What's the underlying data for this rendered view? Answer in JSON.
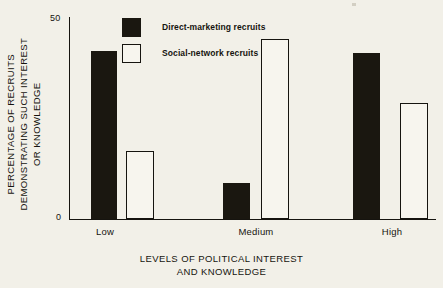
{
  "chart_data": {
    "type": "bar",
    "title": "",
    "xlabel": "LEVELS OF POLITICAL INTEREST AND KNOWLEDGE",
    "ylabel": "PERCENTAGE OF RECRUITS DEMONSTRATING SUCH INTEREST OR KNOWLEDGE",
    "categories": [
      "Low",
      "Medium",
      "High"
    ],
    "series": [
      {
        "name": "Direct-marketing recruits",
        "values": [
          42,
          9,
          41.5
        ],
        "color": "#1a1710",
        "style": "filled"
      },
      {
        "name": "Social-network recruits",
        "values": [
          17,
          45,
          29
        ],
        "color": "#f7f5ee",
        "style": "hollow"
      }
    ],
    "ylim": [
      0,
      50
    ],
    "yticks": [
      "0",
      "50"
    ],
    "grid": false,
    "legend_position": "top-center"
  },
  "axis": {
    "y_title_lines": [
      "PERCENTAGE OF RECRUITS",
      "DEMONSTRATING SUCH INTEREST",
      "OR KNOWLEDGE"
    ],
    "x_title_lines": [
      "LEVELS OF POLITICAL INTEREST",
      "AND KNOWLEDGE"
    ],
    "ytick_top": "50",
    "ytick_bottom": "0"
  },
  "xticks": {
    "low": "Low",
    "medium": "Medium",
    "high": "High"
  },
  "legend": {
    "items": [
      {
        "label": "Direct-marketing recruits",
        "style": "filled"
      },
      {
        "label": "Social-network recruits",
        "style": "hollow"
      }
    ]
  }
}
